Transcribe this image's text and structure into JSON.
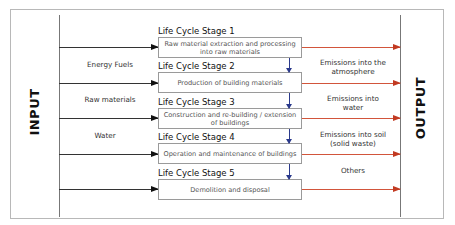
{
  "diagram": {
    "input_label": "INPUT",
    "output_label": "OUTPUT",
    "stages": [
      {
        "label": "Life Cycle Stage 1",
        "description": "Raw material extraction and processing into raw materials"
      },
      {
        "label": "Life Cycle Stage 2",
        "description": "Production of building materials"
      },
      {
        "label": "Life Cycle Stage 3",
        "description": "Construction and re-building / extension of buildings"
      },
      {
        "label": "Life Cycle Stage 4",
        "description": "Operation and maintenance of buildings"
      },
      {
        "label": "Life Cycle Stage 5",
        "description": "Demolition and disposal"
      }
    ],
    "inputs": [
      {
        "label": "Energy Fuels"
      },
      {
        "label": "Raw materials"
      },
      {
        "label": "Water"
      }
    ],
    "outputs": [
      {
        "label": "Emissions into the atmosphere"
      },
      {
        "label": "Emissions into water"
      },
      {
        "label": "Emissions into soil (solid waste)"
      },
      {
        "label": "Others"
      }
    ],
    "colors": {
      "input_arrow": "#111111",
      "output_arrow": "#c23a22",
      "stage_flow_arrow": "#2b3a8c",
      "border": "#b8b8b8"
    }
  }
}
